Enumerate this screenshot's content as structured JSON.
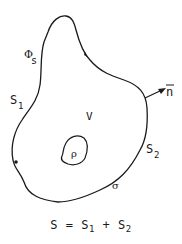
{
  "diagram": {
    "labels": {
      "phi_s": {
        "main": "Φ",
        "sub": "s"
      },
      "s1": {
        "main": "S",
        "sub": "1"
      },
      "s2": {
        "main": "S",
        "sub": "2"
      },
      "volume": "V",
      "rho": "ρ",
      "sigma": "σ",
      "normal": "n"
    },
    "formula": {
      "lhs": "S",
      "eq": " = ",
      "t1": "S",
      "t1_sub": "1",
      "plus": " + ",
      "t2": "S",
      "t2_sub": "2"
    },
    "colors": {
      "stroke": "#1a1a1a",
      "background": "#ffffff"
    }
  }
}
